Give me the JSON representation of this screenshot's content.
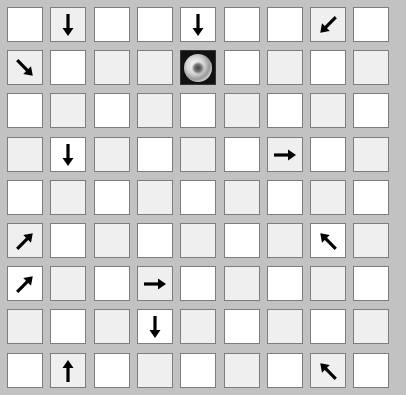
{
  "board": {
    "rows": 9,
    "cols": 9,
    "colors": {
      "background": "#c2c2c2",
      "cell_white": "#ffffff",
      "cell_light": "#efefef",
      "arrow": "#000000"
    },
    "cells": [
      [
        "white",
        "down:light",
        "white",
        "white",
        "down:white",
        "white",
        "white",
        "downleft:light",
        "white"
      ],
      [
        "downright:light",
        "white",
        "light",
        "light",
        "ball",
        "white",
        "light",
        "white",
        "light"
      ],
      [
        "white",
        "light",
        "white",
        "light",
        "white",
        "light",
        "white",
        "light",
        "white"
      ],
      [
        "light",
        "down:white",
        "light",
        "white",
        "light",
        "white",
        "right:light",
        "white",
        "light"
      ],
      [
        "white",
        "light",
        "white",
        "light",
        "white",
        "light",
        "white",
        "light",
        "white"
      ],
      [
        "upright:light",
        "white",
        "light",
        "white",
        "light",
        "white",
        "light",
        "upleft:white",
        "light"
      ],
      [
        "upright:white",
        "light",
        "white",
        "right:light",
        "white",
        "light",
        "white",
        "light",
        "white"
      ],
      [
        "light",
        "white",
        "light",
        "down:white",
        "light",
        "white",
        "light",
        "white",
        "light"
      ],
      [
        "white",
        "up:light",
        "white",
        "light",
        "white",
        "light",
        "white",
        "upleft:light",
        "white"
      ]
    ]
  }
}
